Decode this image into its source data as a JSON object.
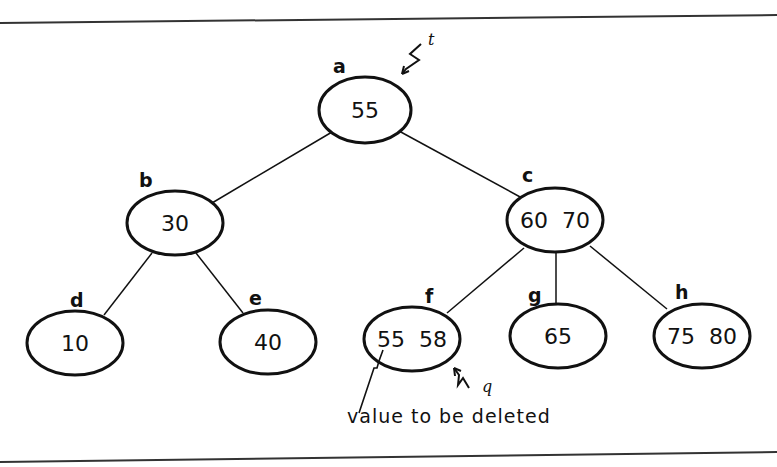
{
  "diagram": {
    "type": "2-3 tree",
    "nodes": [
      {
        "id": "a",
        "label": "a",
        "values": "55",
        "cx": 365,
        "cy": 110,
        "rx": 46,
        "ry": 33
      },
      {
        "id": "b",
        "label": "b",
        "values": "30",
        "cx": 175,
        "cy": 223,
        "rx": 48,
        "ry": 32
      },
      {
        "id": "c",
        "label": "c",
        "values": "60  70",
        "cx": 555,
        "cy": 220,
        "rx": 48,
        "ry": 32
      },
      {
        "id": "d",
        "label": "d",
        "values": "10",
        "cx": 75,
        "cy": 343,
        "rx": 48,
        "ry": 32
      },
      {
        "id": "e",
        "label": "e",
        "values": "40",
        "cx": 268,
        "cy": 342,
        "rx": 48,
        "ry": 32
      },
      {
        "id": "f",
        "label": "f",
        "values": "55  58",
        "cx": 412,
        "cy": 339,
        "rx": 48,
        "ry": 32
      },
      {
        "id": "g",
        "label": "g",
        "values": "65",
        "cx": 558,
        "cy": 336,
        "rx": 48,
        "ry": 32
      },
      {
        "id": "h",
        "label": "h",
        "values": "75  80",
        "cx": 702,
        "cy": 336,
        "rx": 48,
        "ry": 32
      }
    ],
    "edges": [
      {
        "from": "a",
        "to": "b"
      },
      {
        "from": "a",
        "to": "c"
      },
      {
        "from": "b",
        "to": "d"
      },
      {
        "from": "b",
        "to": "e"
      },
      {
        "from": "c",
        "to": "f"
      },
      {
        "from": "c",
        "to": "g"
      },
      {
        "from": "c",
        "to": "h"
      }
    ],
    "pointers": {
      "t": {
        "label": "t",
        "target": "a"
      },
      "q": {
        "label": "q",
        "target": "f"
      }
    },
    "caption": "value to be deleted"
  }
}
